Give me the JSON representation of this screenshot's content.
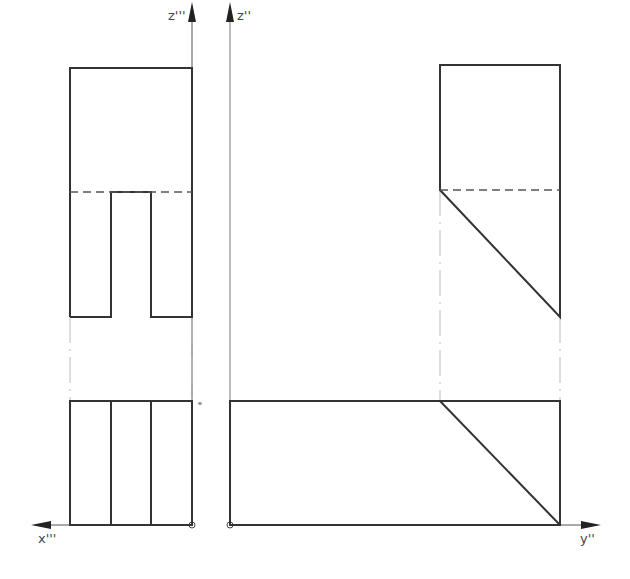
{
  "diagram": {
    "type": "orthographic-projection",
    "colors": {
      "line": "#333333",
      "thin": "#555555",
      "projection": "#bbbbbb",
      "hidden": "#555555",
      "background": "#ffffff"
    },
    "axes": {
      "z_triple": {
        "label": "z'''"
      },
      "z_double": {
        "label": "z''"
      },
      "x_triple": {
        "label": "x'''"
      },
      "y_double": {
        "label": "y''"
      }
    },
    "views": [
      {
        "name": "side-view-upper-left",
        "description": "rectangle with central slot from bottom, hidden line at slot top"
      },
      {
        "name": "top-view-lower-left",
        "description": "rectangle divided into three vertical strips"
      },
      {
        "name": "front-view-upper-right",
        "description": "pentagon with sloped face, hidden line"
      },
      {
        "name": "plan-view-lower-right",
        "description": "long rectangle with diagonal"
      }
    ],
    "marks": {
      "small_mark": "ᵉ"
    }
  }
}
